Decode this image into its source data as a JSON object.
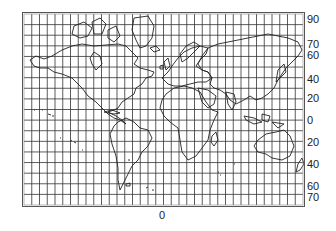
{
  "map": {
    "projection_grid": {
      "columns": 36,
      "rows": 18,
      "line_color": "#333333",
      "frame_color": "#555555"
    },
    "coast_color": "#222222",
    "latitude_labels": [
      {
        "text": "90",
        "y": 14
      },
      {
        "text": "70",
        "y": 39
      },
      {
        "text": "60",
        "y": 50
      },
      {
        "text": "40",
        "y": 74
      },
      {
        "text": "20",
        "y": 93
      },
      {
        "text": "0",
        "y": 115
      },
      {
        "text": "20",
        "y": 137
      },
      {
        "text": "40",
        "y": 159
      },
      {
        "text": "60",
        "y": 181
      },
      {
        "text": "70",
        "y": 192
      }
    ],
    "longitude_labels": [
      {
        "text": "0",
        "x": 159,
        "y": 210
      }
    ]
  }
}
